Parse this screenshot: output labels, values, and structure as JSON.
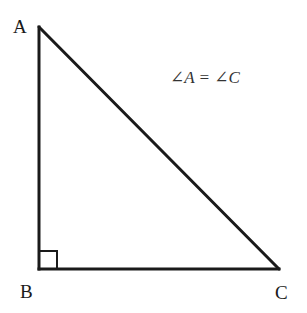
{
  "diagram": {
    "type": "right-triangle",
    "vertices": {
      "A": {
        "label": "A",
        "x": 39,
        "y": 27
      },
      "B": {
        "label": "B",
        "x": 39,
        "y": 269
      },
      "C": {
        "label": "C",
        "x": 279,
        "y": 269
      }
    },
    "right_angle_at": "B",
    "right_angle_marker_size": 18,
    "equation": "∠A = ∠C",
    "stroke_color": "#1a1a1a"
  }
}
